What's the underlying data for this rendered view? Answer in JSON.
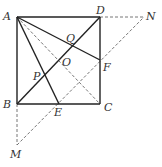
{
  "diagram": {
    "type": "geometry",
    "colors": {
      "solid_line": "#222222",
      "dashed_line": "#666666",
      "label": "#333333",
      "background": "#ffffff"
    },
    "points": {
      "A": {
        "label": "A",
        "x": 17,
        "y": 17
      },
      "B": {
        "label": "B",
        "x": 17,
        "y": 104
      },
      "C": {
        "label": "C",
        "x": 100,
        "y": 104
      },
      "D": {
        "label": "D",
        "x": 100,
        "y": 17
      },
      "E": {
        "label": "E",
        "x": 59,
        "y": 104
      },
      "F": {
        "label": "F",
        "x": 100,
        "y": 60
      },
      "O": {
        "label": "O",
        "x": 59,
        "y": 60
      },
      "P": {
        "label": "P",
        "x": 44,
        "y": 77
      },
      "Q": {
        "label": "Q",
        "x": 72,
        "y": 45
      },
      "M": {
        "label": "M",
        "x": 17,
        "y": 145
      },
      "N": {
        "label": "N",
        "x": 144,
        "y": 17
      }
    },
    "solid_segments": [
      [
        "A",
        "B"
      ],
      [
        "B",
        "C"
      ],
      [
        "C",
        "D"
      ],
      [
        "D",
        "A"
      ],
      [
        "B",
        "D"
      ],
      [
        "A",
        "E"
      ],
      [
        "A",
        "F"
      ]
    ],
    "dashed_segments": [
      [
        "A",
        "C"
      ],
      [
        "D",
        "N"
      ],
      [
        "B",
        "M"
      ],
      [
        "M",
        "N"
      ]
    ]
  }
}
